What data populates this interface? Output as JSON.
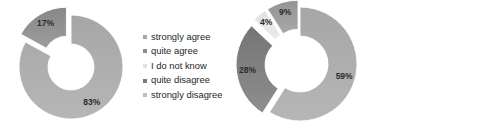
{
  "figure": {
    "background": "#ffffff",
    "charts": [
      {
        "id": "left-donut",
        "name": "donut-chart-left",
        "chart_data": {
          "type": "pie",
          "subtype": "doughnut",
          "title": "",
          "xlabel": "",
          "ylabel": "",
          "legend_position": "right",
          "grid": false,
          "hole_ratio": 0.44,
          "start_angle_deg": 0,
          "direction": "clockwise",
          "categories": [
            "strongly agree",
            "quite agree",
            "I do not know",
            "quite disagree",
            "strongly disagree"
          ],
          "values": [
            83,
            0,
            0,
            0,
            17
          ],
          "slices": [
            {
              "label": "strongly agree",
              "value": 83,
              "display": "83%",
              "color": "#a6a6a6",
              "exploded": false
            },
            {
              "label": "quite agree",
              "value": 0,
              "display": "",
              "color": "#8c8c8c",
              "exploded": false
            },
            {
              "label": "I do not know",
              "value": 0,
              "display": "",
              "color": "#e8e8e8",
              "exploded": false
            },
            {
              "label": "quite disagree",
              "value": 0,
              "display": "",
              "color": "#7a7a7a",
              "exploded": false
            },
            {
              "label": "strongly disagree",
              "value": 17,
              "display": "17%",
              "color": "#878787",
              "exploded": true
            }
          ]
        },
        "legend": {
          "name": "legend-left",
          "items": [
            {
              "label": "strongly agree",
              "color": "#a6a6a6"
            },
            {
              "label": "quite agree",
              "color": "#8c8c8c"
            },
            {
              "label": "I do not know",
              "color": "#e0e0e0"
            },
            {
              "label": "quite disagree",
              "color": "#7a7a7a"
            },
            {
              "label": "strongly disagree",
              "color": "#bdbdbd"
            }
          ]
        }
      },
      {
        "id": "right-donut",
        "name": "donut-chart-right",
        "chart_data": {
          "type": "pie",
          "subtype": "doughnut",
          "title": "",
          "xlabel": "",
          "ylabel": "",
          "legend_position": "right",
          "grid": false,
          "hole_ratio": 0.49,
          "start_angle_deg": 0,
          "direction": "clockwise",
          "categories": [
            "strongly agree",
            "quite agree",
            "I do not know",
            "quite disagree",
            "strongly disagree"
          ],
          "values": [
            59,
            28,
            4,
            9,
            0
          ],
          "slices": [
            {
              "label": "strongly agree",
              "value": 59,
              "display": "59%",
              "color": "#a6a6a6",
              "exploded": false
            },
            {
              "label": "quite agree",
              "value": 28,
              "display": "28%",
              "color": "#757575",
              "exploded": true
            },
            {
              "label": "I do not know",
              "value": 4,
              "display": "4%",
              "color": "#e4e4e4",
              "exploded": true
            },
            {
              "label": "quite disagree",
              "value": 9,
              "display": "9%",
              "color": "#949494",
              "exploded": true
            },
            {
              "label": "strongly disagree",
              "value": 0,
              "display": "",
              "color": "#c9c9c9",
              "exploded": false
            }
          ]
        },
        "legend": {
          "name": "legend-right",
          "items": [
            {
              "label": "strongly agree",
              "color": "#a6a6a6"
            },
            {
              "label": "quite agree",
              "color": "#757575"
            },
            {
              "label": "I do not know",
              "color": "#e4e4e4"
            },
            {
              "label": "quite disagree",
              "color": "#949494"
            },
            {
              "label": "strongly disagree",
              "color": "#c9c9c9"
            }
          ]
        }
      }
    ]
  }
}
